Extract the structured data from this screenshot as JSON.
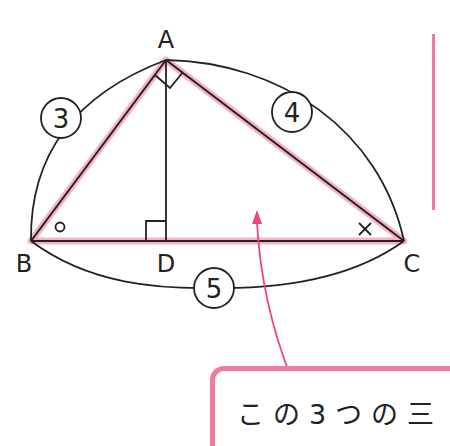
{
  "diagram": {
    "type": "right-triangle-similarity",
    "vertices": {
      "A": {
        "label": "A",
        "x": 166,
        "y": 60
      },
      "B": {
        "label": "B",
        "x": 31,
        "y": 241
      },
      "C": {
        "label": "C",
        "x": 404,
        "y": 241
      },
      "D": {
        "label": "D",
        "x": 166,
        "y": 241
      }
    },
    "side_labels": {
      "AB": "3",
      "AC": "4",
      "BC": "5"
    },
    "angle_marks": {
      "B": "○",
      "C": "×"
    },
    "right_angles": [
      "A",
      "D"
    ],
    "highlight_color": "#f4a6b8",
    "line_color": "#222222",
    "accent_color": "#f07c9c"
  },
  "note": {
    "text": "この3つの三"
  }
}
